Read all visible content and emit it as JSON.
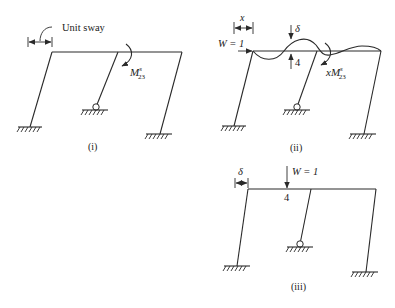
{
  "figure": {
    "panels": [
      {
        "id": "i",
        "caption": "(i)",
        "labels": {
          "sway": "Unit sway",
          "moment_base": "M",
          "moment_sup": "s",
          "moment_sub": "23"
        }
      },
      {
        "id": "ii",
        "caption": "(ii)",
        "labels": {
          "x": "x",
          "load": "W = 1",
          "delta": "δ",
          "node": "4",
          "moment_prefix": "x",
          "moment_base": "M",
          "moment_sup": "s",
          "moment_sub": "23"
        }
      },
      {
        "id": "iii",
        "caption": "(iii)",
        "labels": {
          "delta": "δ",
          "load": "W = 1",
          "node": "4"
        }
      }
    ]
  },
  "colors": {
    "line": "#2a2a2a",
    "background": "#ffffff"
  }
}
